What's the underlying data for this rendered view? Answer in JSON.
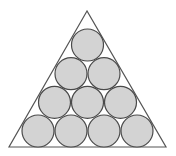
{
  "diagram": {
    "colors": {
      "background": "#ffffff",
      "triangle_stroke": "#555555",
      "circle_fill": "#d3d3d3",
      "circle_stroke": "#4a4a4a"
    },
    "triangle": {
      "apex": [
        87,
        11
      ],
      "bottom_left": [
        9,
        147
      ],
      "bottom_right": [
        166,
        147
      ]
    },
    "circle_radius": 16,
    "rows": [
      {
        "row": 1,
        "count": 1,
        "cy": 45,
        "cx": [
          87.5
        ]
      },
      {
        "row": 2,
        "count": 2,
        "cy": 73.7,
        "cx": [
          71,
          104
        ]
      },
      {
        "row": 3,
        "count": 3,
        "cy": 102.3,
        "cx": [
          54.5,
          87.5,
          120.5
        ]
      },
      {
        "row": 4,
        "count": 4,
        "cy": 131,
        "cx": [
          38,
          71,
          104,
          137
        ]
      }
    ],
    "total_circles": 10
  }
}
